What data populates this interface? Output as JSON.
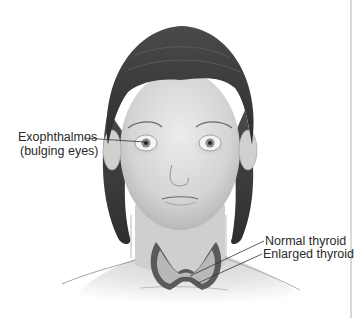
{
  "figure": {
    "labels": {
      "exophthalmos": "Exophthalmos",
      "exophthalmos_note": "(bulging eyes)",
      "normal_thyroid": "Normal thyroid",
      "enlarged_thyroid": "Enlarged thyroid"
    },
    "colors": {
      "background": "#ffffff",
      "hair": "#3a3a3a",
      "skin": "#d8d8d8",
      "thyroid_enlarged": "#555555",
      "thyroid_normal": "#b8b8b8",
      "label_text": "#2a2a2a",
      "leader_line": "#333333",
      "frame_edge": "#d9d9d9"
    }
  }
}
